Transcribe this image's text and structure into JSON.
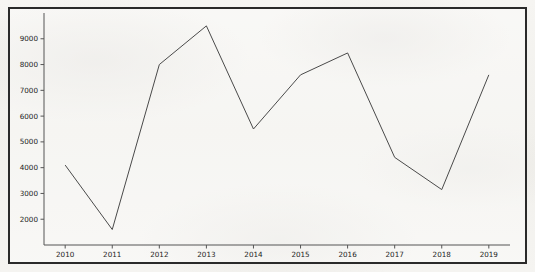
{
  "chart_data": {
    "type": "line",
    "title": "",
    "subtitle": "",
    "xlabel": "",
    "ylabel": "",
    "categories": [
      2010,
      2011,
      2012,
      2013,
      2014,
      2015,
      2016,
      2017,
      2018,
      2019
    ],
    "x": [
      2010,
      2011,
      2012,
      2013,
      2014,
      2015,
      2016,
      2017,
      2018,
      2019
    ],
    "values": [
      4100,
      1600,
      8000,
      9500,
      5500,
      7600,
      8450,
      4400,
      3150,
      7600
    ],
    "series": [
      {
        "name": "series-1",
        "values": [
          4100,
          1600,
          8000,
          9500,
          5500,
          7600,
          8450,
          4400,
          3150,
          7600
        ],
        "color": "#4a4a4a",
        "line_width": 1,
        "marker": "none"
      }
    ],
    "xtick_labels": [
      "2010",
      "2011",
      "2012",
      "2013",
      "2014",
      "2015",
      "2016",
      "2017",
      "2018",
      "2019"
    ],
    "ytick_labels": [
      "2000",
      "3000",
      "4000",
      "5000",
      "6000",
      "7000",
      "8000",
      "9000"
    ],
    "ytick_values": [
      2000,
      3000,
      4000,
      5000,
      6000,
      7000,
      8000,
      9000
    ],
    "xlim": [
      2009.55,
      2019.45
    ],
    "ylim": [
      1000,
      10000
    ],
    "grid": false,
    "legend": false,
    "legend_position": "none"
  },
  "figure": {
    "background_color": "#f4f3f0",
    "plot_background_color": "#ffffff",
    "frame_color": "#2a2a2a",
    "axis_color": "#555555",
    "tick_label_color": "#1c1c1c"
  }
}
